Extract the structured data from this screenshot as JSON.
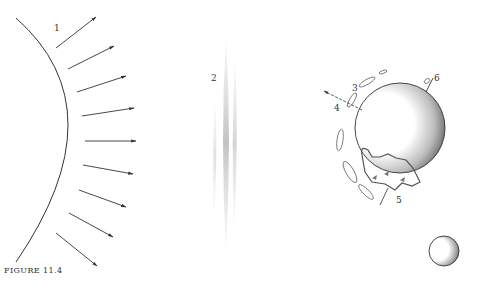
{
  "figure": {
    "caption": "FIGURE 11.4",
    "labels": {
      "l1": "1",
      "l2": "2",
      "l3": "3",
      "l4": "4",
      "l5": "5",
      "l6": "6"
    },
    "elements": [
      {
        "id": "1",
        "name": "sun-surface-with-radiating-arrows",
        "arrow_count": 10
      },
      {
        "id": "2",
        "name": "diffuse-cloud-streak"
      },
      {
        "id": "3",
        "name": "cloud-wisps-around-earth"
      },
      {
        "id": "4",
        "name": "outgoing-arrow-left"
      },
      {
        "id": "5",
        "name": "landmass-on-earth"
      },
      {
        "id": "6",
        "name": "axis-marker-top-right"
      },
      {
        "id": "moon",
        "name": "small-crescent-sphere"
      }
    ],
    "colors": {
      "ink": "#333333",
      "paper": "#ffffff",
      "haze": "#c8c8c8"
    }
  }
}
